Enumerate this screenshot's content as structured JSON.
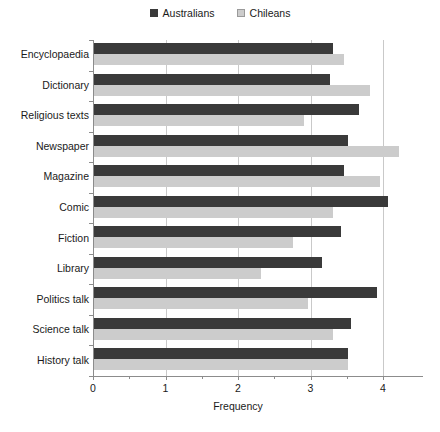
{
  "chart_data": {
    "type": "bar",
    "orientation": "horizontal",
    "title": "",
    "xlabel": "Frequency",
    "ylabel": "",
    "xlim": [
      0,
      4.5
    ],
    "xticks": [
      0,
      1,
      2,
      3,
      4
    ],
    "xtick_labels": [
      "0",
      "1",
      "2",
      "3",
      "4"
    ],
    "minor_xticks": [
      0.5,
      1.5,
      2.5,
      3.5
    ],
    "grid": "vertical",
    "legend_position": "top-center",
    "categories": [
      "Encyclopaedia",
      "Dictionary",
      "Religious texts",
      "Newspaper",
      "Magazine",
      "Comic",
      "Fiction",
      "Library",
      "Politics talk",
      "Science talk",
      "History talk"
    ],
    "series": [
      {
        "name": "Australians",
        "color": "#3a3a3a",
        "values": [
          3.3,
          3.25,
          3.65,
          3.5,
          3.45,
          4.05,
          3.4,
          3.15,
          3.9,
          3.55,
          3.5
        ]
      },
      {
        "name": "Chileans",
        "color": "#cccccc",
        "values": [
          3.45,
          3.8,
          2.9,
          4.2,
          3.95,
          3.3,
          2.75,
          2.3,
          2.95,
          3.3,
          3.5
        ]
      }
    ]
  },
  "legend": {
    "entries": [
      {
        "label": "Australians",
        "swatch": "dark-square-marker"
      },
      {
        "label": "Chileans",
        "swatch": "light-square-marker"
      }
    ]
  },
  "axis": {
    "x_title": "Frequency"
  }
}
